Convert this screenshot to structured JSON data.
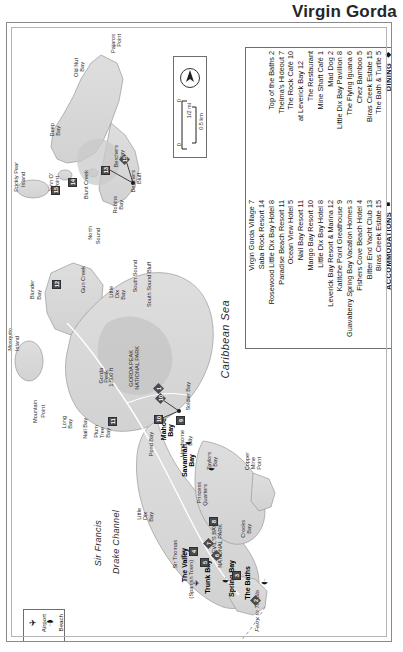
{
  "title": "Virgin Gorda",
  "panel": {
    "dining": {
      "heading": "DINING",
      "heading_symbol": "◆",
      "items": [
        "The Bath & Turtle 5",
        "Biras Creek Estate 15",
        "Chez Bamboo 5",
        "The Flying Iguana 6",
        "Little Dix Bay Pavillion 8",
        "Mad Dog 2",
        "Mine Shaft Café 1",
        "The Restaurant",
        "at Leverick Bay 12",
        "The Rock Café 10",
        "Thelma's Hideout 7",
        "Top of the Baths 2"
      ]
    },
    "accommodations": {
      "heading": "ACCOMMODATIONS",
      "heading_symbol": "■",
      "items": [
        "Biras Creek Estate 15",
        "Bitter End Yacht Club 13",
        "Fishers Cove Beach Hotel 4",
        "Guavaberry Spring Bay Vacation Homes 3",
        "Katitche Point Greathouse 9",
        "Leverick Bay Resort & Marina 12",
        "Little Dix Bay Hotel 8",
        "Mango Bay Resort 10",
        "Nail Bay Resort 11",
        "Ocean View Hotel 5",
        "Paradise Beach Resort 11",
        "Rosewood Little Dix Bay Hotel 8",
        "Saba Rock Resort 14",
        "Virgin Gorda Village 7"
      ]
    }
  },
  "compass": {
    "north_label": "N",
    "scale_miles": "1/2 mi",
    "scale_km": "0.5 km",
    "scale_zero_left": "0",
    "scale_zero_right": "0"
  },
  "key": {
    "airport": "Airport",
    "beach": "Beach",
    "airport_icon": "airplane-icon",
    "beach_icon": "beach-umbrella-icon"
  },
  "map_labels": {
    "points": [
      {
        "text": "Pajaros",
        "x": 110,
        "y": 34
      },
      {
        "text": "Point",
        "x": 116,
        "y": 34
      },
      {
        "text": "Old Nut",
        "x": 73,
        "y": 58
      },
      {
        "text": "Bay",
        "x": 79,
        "y": 62
      },
      {
        "text": "Deep",
        "x": 49,
        "y": 123
      },
      {
        "text": "Bay",
        "x": 55,
        "y": 126
      },
      {
        "text": "Berchers",
        "x": 113,
        "y": 145
      },
      {
        "text": "Bay",
        "x": 119,
        "y": 150
      },
      {
        "text": "Berchers",
        "x": 130,
        "y": 170
      },
      {
        "text": "Bluff",
        "x": 136,
        "y": 173
      },
      {
        "text": "Prickly Pear",
        "x": 13,
        "y": 162
      },
      {
        "text": "Island",
        "x": 20,
        "y": 172
      },
      {
        "text": "John O'",
        "x": 48,
        "y": 173
      },
      {
        "text": "Point",
        "x": 54,
        "y": 176
      },
      {
        "text": "Blunt Creek",
        "x": 83,
        "y": 170
      },
      {
        "text": "Robins",
        "x": 112,
        "y": 196
      },
      {
        "text": "Bay",
        "x": 118,
        "y": 200
      },
      {
        "text": "North",
        "x": 87,
        "y": 226
      },
      {
        "text": "Sound",
        "x": 95,
        "y": 228
      },
      {
        "text": "Gun Creek",
        "x": 80,
        "y": 266
      },
      {
        "text": "South Sound",
        "x": 132,
        "y": 260
      },
      {
        "text": "Little",
        "x": 108,
        "y": 286
      },
      {
        "text": "Dix",
        "x": 114,
        "y": 290
      },
      {
        "text": "Bay",
        "x": 120,
        "y": 290
      },
      {
        "text": "South Sound Bluff",
        "x": 146,
        "y": 262
      },
      {
        "text": "Blunder",
        "x": 29,
        "y": 280
      },
      {
        "text": "Bay",
        "x": 36,
        "y": 290
      },
      {
        "text": "Mosquito",
        "x": 7,
        "y": 328
      },
      {
        "text": "Island",
        "x": 14,
        "y": 336
      },
      {
        "text": "GORDA PEAK",
        "x": 128,
        "y": 350
      },
      {
        "text": "NATIONAL PARK",
        "x": 134,
        "y": 346
      },
      {
        "text": "Gorda",
        "x": 98,
        "y": 368
      },
      {
        "text": "Peak",
        "x": 103,
        "y": 370
      },
      {
        "text": "1,500 ft",
        "x": 108,
        "y": 368
      },
      {
        "text": "Mountain",
        "x": 32,
        "y": 400
      },
      {
        "text": "Point",
        "x": 40,
        "y": 405
      },
      {
        "text": "Long",
        "x": 61,
        "y": 416
      },
      {
        "text": "Bay",
        "x": 67,
        "y": 419
      },
      {
        "text": "Nail Bay",
        "x": 82,
        "y": 418
      },
      {
        "text": "Plum",
        "x": 93,
        "y": 425
      },
      {
        "text": "Tree",
        "x": 99,
        "y": 427
      },
      {
        "text": "Bay",
        "x": 105,
        "y": 428
      },
      {
        "text": "Soldier Bay",
        "x": 185,
        "y": 382
      },
      {
        "text": "Pond Bay",
        "x": 148,
        "y": 432
      },
      {
        "text": "Handsome",
        "x": 179,
        "y": 430
      },
      {
        "text": "Bay",
        "x": 187,
        "y": 436
      },
      {
        "text": "Taylors",
        "x": 206,
        "y": 452
      },
      {
        "text": "Bay",
        "x": 212,
        "y": 457
      },
      {
        "text": "Princess",
        "x": 196,
        "y": 482
      },
      {
        "text": "Quarters",
        "x": 202,
        "y": 484
      },
      {
        "text": "Copper",
        "x": 244,
        "y": 452
      },
      {
        "text": "Mine",
        "x": 250,
        "y": 457
      },
      {
        "text": "Point",
        "x": 256,
        "y": 457
      },
      {
        "text": "Little",
        "x": 136,
        "y": 508
      },
      {
        "text": "Dix",
        "x": 142,
        "y": 512
      },
      {
        "text": "Bay",
        "x": 148,
        "y": 512
      },
      {
        "text": "Sir Thomas",
        "x": 172,
        "y": 540
      },
      {
        "text": "Bay",
        "x": 180,
        "y": 548
      },
      {
        "text": "DEVIL'S BAY",
        "x": 211,
        "y": 524
      },
      {
        "text": "NATIONAL PARK",
        "x": 217,
        "y": 524
      },
      {
        "text": "Crooks",
        "x": 240,
        "y": 520
      },
      {
        "text": "Bay",
        "x": 246,
        "y": 524
      },
      {
        "text": "(Spanish Town)",
        "x": 188,
        "y": 560
      }
    ],
    "towns": [
      {
        "text": "Mahoe",
        "x": 160,
        "y": 418,
        "bold": true
      },
      {
        "text": "Bay",
        "x": 167,
        "y": 424,
        "bold": true
      },
      {
        "text": "Savannah",
        "x": 181,
        "y": 444,
        "bold": true
      },
      {
        "text": "Bay",
        "x": 188,
        "y": 454,
        "bold": true
      },
      {
        "text": "The Valley",
        "x": 181,
        "y": 548,
        "bold": true
      },
      {
        "text": "Trunk Bay",
        "x": 204,
        "y": 560,
        "bold": true
      },
      {
        "text": "Spring Bay",
        "x": 228,
        "y": 560,
        "bold": true
      },
      {
        "text": "The Baths",
        "x": 244,
        "y": 566,
        "bold": true
      }
    ],
    "waters": [
      {
        "text": "Caribbean Sea",
        "x": 219,
        "y": 300,
        "size": "big"
      },
      {
        "text": "Sir Francis",
        "x": 93,
        "y": 520,
        "size": "med"
      },
      {
        "text": "Drake Channel",
        "x": 111,
        "y": 510,
        "size": "med"
      },
      {
        "text": "Ferry to Tortola",
        "x": 253,
        "y": 590,
        "size": "small"
      }
    ]
  },
  "markers": [
    {
      "n": "15",
      "x": 112,
      "y": 131,
      "shape": "diamond"
    },
    {
      "n": "13",
      "x": 94,
      "y": 143,
      "shape": "square"
    },
    {
      "n": "14",
      "x": 61,
      "y": 155,
      "shape": "square"
    },
    {
      "n": "15",
      "x": 44,
      "y": 163,
      "shape": "square"
    },
    {
      "n": "12",
      "x": 45,
      "y": 257,
      "shape": "square"
    },
    {
      "n": "11",
      "x": 101,
      "y": 394,
      "shape": "square"
    },
    {
      "n": "10",
      "x": 147,
      "y": 392,
      "shape": "square"
    },
    {
      "n": "10",
      "x": 148,
      "y": 370,
      "shape": "diamond"
    },
    {
      "n": "9",
      "x": 169,
      "y": 393,
      "shape": "square"
    },
    {
      "n": "8",
      "x": 202,
      "y": 494,
      "shape": "square"
    },
    {
      "n": "7",
      "x": 196,
      "y": 515,
      "shape": "diamond"
    },
    {
      "n": "6",
      "x": 204,
      "y": 527,
      "shape": "diamond"
    },
    {
      "n": "5",
      "x": 193,
      "y": 535,
      "shape": "square"
    },
    {
      "n": "4",
      "x": 182,
      "y": 524,
      "shape": "square"
    },
    {
      "n": "3",
      "x": 225,
      "y": 548,
      "shape": "square"
    },
    {
      "n": "2",
      "x": 243,
      "y": 572,
      "shape": "diamond"
    },
    {
      "n": "1",
      "x": 146,
      "y": 360,
      "shape": "diamond"
    }
  ]
}
